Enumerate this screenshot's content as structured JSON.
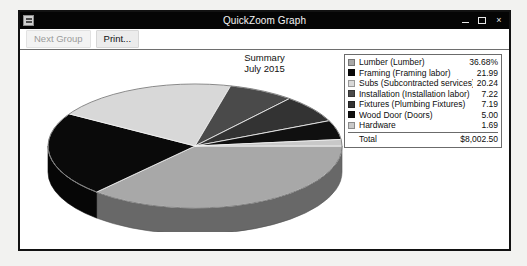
{
  "window": {
    "title": "QuickZoom Graph",
    "icon": "app-icon",
    "controls": {
      "minimize": "–",
      "maximize": "□",
      "close": "×"
    }
  },
  "toolbar": {
    "next_group_label": "Next Group",
    "print_label": "Print..."
  },
  "chart_data": {
    "type": "pie",
    "title": "Summary",
    "subtitle": "July 2015",
    "three_d": true,
    "categories": [
      "Lumber (Lumber)",
      "Framing (Framing labor)",
      "Subs (Subcontracted services)",
      "Installation (Installation labor)",
      "Fixtures (Plumbing Fixtures)",
      "Wood Door (Doors)",
      "Hardware"
    ],
    "values": [
      36.68,
      21.99,
      20.24,
      7.22,
      7.19,
      5.0,
      1.69
    ],
    "value_labels": [
      "36.68%",
      "21.99",
      "20.24",
      "7.22",
      "7.19",
      "5.00",
      "1.69"
    ],
    "colors": [
      "#a8a8a8",
      "#0a0a0a",
      "#d8d8d8",
      "#4a4a4a",
      "#333333",
      "#101010",
      "#c8c8c8"
    ],
    "unit": "percent",
    "total_label": "Total",
    "total_value": "$8,002.50",
    "legend_position": "right"
  }
}
